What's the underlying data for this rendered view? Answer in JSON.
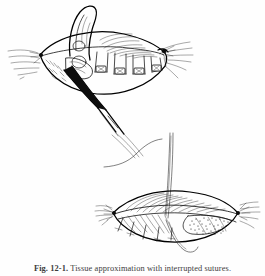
{
  "figure": {
    "domain": "medical-surgical-illustration",
    "style": "pen-and-ink line drawing, black on white, scanned book page",
    "background_color": "#fefefe",
    "ink_color": "#111111",
    "caption": {
      "label": "Fig. 12-1.",
      "text": "Tissue approximation with interrupted sutures.",
      "full": "Fig. 12-1. Tissue approximation with interrupted sutures."
    },
    "panels": [
      {
        "id": "upper-panel",
        "name": "wound-with-placed-sutures",
        "position": "top-left",
        "description": "Elliptical wound held open, tissue flap retracted upward, row of interrupted sutures tied across the closure line, forceps entering from lower left.",
        "elements": [
          "retracted-tissue-flap",
          "wound-ellipse",
          "suture-row",
          "knot-left-corner",
          "knot-right-corner",
          "tension-lines-left",
          "tension-lines-right",
          "forceps-instrument",
          "hatching-shading"
        ],
        "suture_count": 5
      },
      {
        "id": "lower-panel",
        "name": "wound-with-running-suture",
        "position": "bottom-right",
        "description": "Elliptical wound closed along upper edge with long suture thread drawn up out of frame; small interrupted stitches along lower border; stippled granular tissue at right of wound cavity.",
        "elements": [
          "long-suture-thread",
          "curved-thread-tails",
          "wound-ellipse",
          "stitch-row-lower",
          "stippled-tissue",
          "tension-lines-left",
          "tension-lines-right",
          "hatching-shading"
        ],
        "stitch_count": 5
      }
    ]
  }
}
